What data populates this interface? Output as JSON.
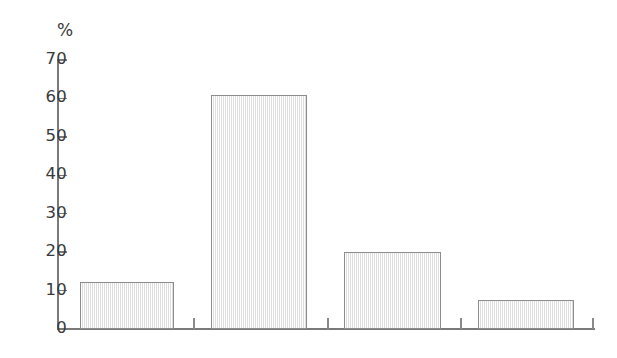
{
  "chart_data": {
    "type": "bar",
    "title": "",
    "subtitle": "",
    "xlabel": "",
    "ylabel": "%",
    "unit_label": "%",
    "categories": [
      "1",
      "2",
      "3",
      "4"
    ],
    "values": [
      12.3,
      60.8,
      20.0,
      7.6
    ],
    "series": [
      {
        "name": "",
        "values": [
          12.3,
          60.8,
          20.0,
          7.6
        ]
      }
    ],
    "ylim": [
      0,
      70
    ],
    "ytick_values": [
      0,
      10,
      20,
      30,
      40,
      50,
      60,
      70
    ],
    "ytick_labels": [
      "0",
      "10",
      "20",
      "30",
      "40",
      "50",
      "60",
      "70"
    ],
    "xtick_labels": [
      "",
      "",
      "",
      "",
      ""
    ],
    "grid": false,
    "legend": false,
    "legend_position": "none",
    "annotations": []
  },
  "style": {
    "bar_fill": "#f2f2f2",
    "bar_border": "#8c8c8c",
    "axis_color": "#7a7a7a",
    "tick_color": "#8a8a8a",
    "text_color": "#3a3a3a",
    "background": "#ffffff"
  }
}
